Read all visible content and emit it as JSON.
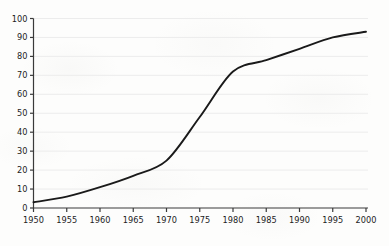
{
  "chart_data": {
    "type": "line",
    "title": "",
    "subtitle": "",
    "xlabel": "",
    "ylabel": "",
    "x": [
      1950,
      1955,
      1960,
      1965,
      1970,
      1975,
      1980,
      1985,
      1990,
      1995,
      2000
    ],
    "categories": [
      "1950",
      "1955",
      "1960",
      "1965",
      "1970",
      "1975",
      "1980",
      "1985",
      "1990",
      "1995",
      "2000"
    ],
    "values": [
      3,
      6,
      11,
      17,
      25,
      48,
      72,
      78,
      84,
      90,
      93
    ],
    "series": [
      {
        "name": "",
        "values": [
          3,
          6,
          11,
          17,
          25,
          48,
          72,
          78,
          84,
          90,
          93
        ]
      }
    ],
    "xlim": [
      1950,
      2000
    ],
    "ylim": [
      0,
      100
    ],
    "x_ticks": [
      "1950",
      "1955",
      "1960",
      "1965",
      "1970",
      "1975",
      "1980",
      "1985",
      "1990",
      "1995",
      "2000"
    ],
    "y_ticks": [
      "0",
      "10",
      "20",
      "30",
      "40",
      "50",
      "60",
      "70",
      "80",
      "90",
      "100"
    ],
    "grid": "horizontal",
    "legend": "none",
    "line_color": "#1a1a1a",
    "grid_color": "#ececec",
    "axis_color": "#3a3a3a",
    "background_color": "#fdfdfc",
    "annotations": []
  }
}
